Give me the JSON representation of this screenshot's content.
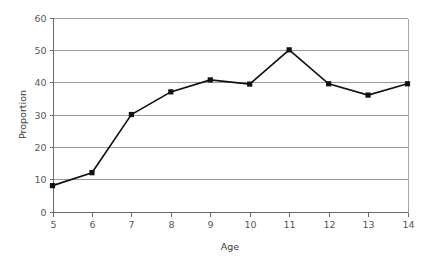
{
  "chart_data": {
    "type": "line",
    "title": "",
    "xlabel": "Age",
    "ylabel": "Proportion",
    "x": [
      5,
      6,
      7,
      8,
      9,
      10,
      11,
      12,
      13,
      14
    ],
    "values": [
      8,
      12,
      30,
      37,
      40.7,
      39.4,
      50,
      39.5,
      36,
      39.5
    ],
    "categories": [
      "5",
      "6",
      "7",
      "8",
      "9",
      "10",
      "11",
      "12",
      "13",
      "14"
    ],
    "xtick_labels": [
      "5",
      "6",
      "7",
      "8",
      "9",
      "10",
      "11",
      "12",
      "13",
      "14"
    ],
    "ytick_labels": [
      "0",
      "10",
      "20",
      "30",
      "40",
      "50",
      "60"
    ],
    "yticks": [
      0,
      10,
      20,
      30,
      40,
      50,
      60
    ],
    "xlim": [
      5,
      14
    ],
    "ylim": [
      0,
      60
    ],
    "grid": true,
    "grid_axis": "y",
    "legend": false,
    "legend_position": "none",
    "marker": "square",
    "colors": {
      "line": "#111111",
      "marker": "#111111",
      "gridline": "#9a9a9c",
      "axis": "#6b6b6d",
      "tick_text": "#58585a",
      "background": "#ffffff"
    },
    "series": [
      {
        "name": "Proportion",
        "values": [
          8,
          12,
          30,
          37,
          40.7,
          39.4,
          50,
          39.5,
          36,
          39.5
        ]
      }
    ]
  }
}
